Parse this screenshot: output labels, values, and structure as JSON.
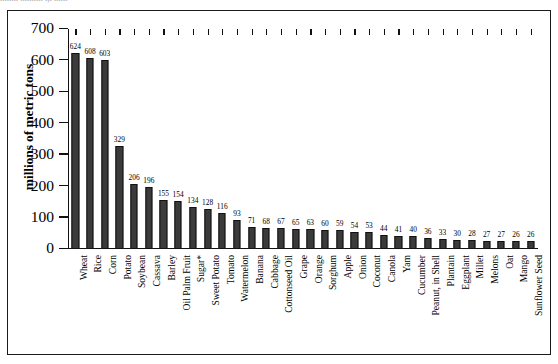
{
  "top_sliver_text": "........ .......... .,. ......",
  "chart_data": {
    "type": "bar",
    "title": "",
    "subtitle": "",
    "xlabel": "",
    "ylabel": "millions of metric tons",
    "ylim": [
      0,
      700
    ],
    "ytick_labels": [
      "0",
      "100",
      "200",
      "300",
      "400",
      "500",
      "600",
      "700"
    ],
    "yticks": [
      0,
      100,
      200,
      300,
      400,
      500,
      600,
      700
    ],
    "grid": false,
    "legend": null,
    "bar_color": "#3b3b3b",
    "bar_edge_color": "#111111",
    "show_value_labels": true,
    "footnote_marker": "*",
    "categories": [
      "Wheat",
      "Rice",
      "Corn",
      "Potato",
      "Soybean",
      "Cassava",
      "Barley",
      "Oil Palm Fruit",
      "Sugar*",
      "Sweet Potato",
      "Tomato",
      "Watermelon",
      "Banana",
      "Cabbage",
      "Cottonseed Oil",
      "Grape",
      "Orange",
      "Sorghum",
      "Apple",
      "Onion",
      "Coconut",
      "Canola",
      "Yam",
      "Cucumber",
      "Peanut, in Shell",
      "Plantain",
      "Eggplant",
      "Millet",
      "Melons",
      "Oat",
      "Mango",
      "Sunflower Seed"
    ],
    "values": [
      624,
      608,
      603,
      329,
      206,
      196,
      155,
      154,
      134,
      128,
      116,
      93,
      71,
      68,
      67,
      65,
      63,
      60,
      59,
      54,
      53,
      44,
      41,
      40,
      36,
      33,
      30,
      28,
      27,
      27,
      26,
      26
    ]
  }
}
